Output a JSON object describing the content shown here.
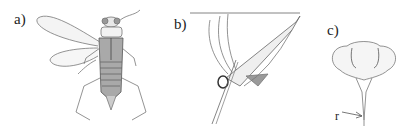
{
  "figure": {
    "panels": [
      {
        "label": "a)",
        "content": "dorsal view of insect with spread wings"
      },
      {
        "label": "b)",
        "content": "lateral view of insect hanging from surface line"
      },
      {
        "label": "c)",
        "content": "frontal view of head with rostrum"
      }
    ],
    "annotations": [
      {
        "label": "r",
        "target": "rostrum"
      }
    ]
  }
}
